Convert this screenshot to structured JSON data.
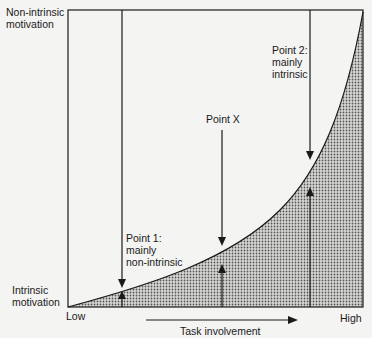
{
  "labels": {
    "y_top": [
      "Non-intrinsic",
      "motivation"
    ],
    "y_bottom": [
      "Intrinsic",
      "motivation"
    ],
    "x_low": "Low",
    "x_high": "High",
    "x_axis": "Task involvement"
  },
  "points": [
    {
      "id": "point-1",
      "lines": [
        "Point 1:",
        "mainly",
        "non-intrinsic"
      ]
    },
    {
      "id": "point-x",
      "lines": [
        "Point X"
      ]
    },
    {
      "id": "point-2",
      "lines": [
        "Point 2:",
        "mainly",
        "intrinsic"
      ]
    }
  ],
  "colors": {
    "line": "#1a1a1a",
    "fill_pattern": "#555555",
    "background": "#f4f4f2"
  }
}
